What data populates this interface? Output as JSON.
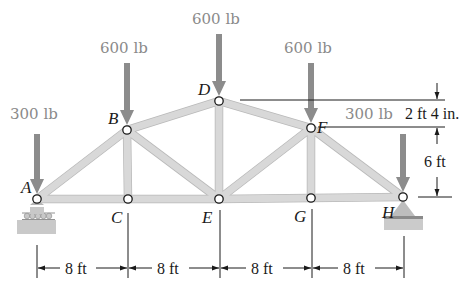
{
  "diagram": {
    "type": "truss",
    "nodes": [
      {
        "id": "A",
        "x": 37,
        "y": 199,
        "label_dx": -16,
        "label_dy": -6
      },
      {
        "id": "B",
        "x": 127,
        "y": 130,
        "label_dx": -19,
        "label_dy": -6
      },
      {
        "id": "C",
        "x": 128,
        "y": 199,
        "label_dx": -17,
        "label_dy": 24
      },
      {
        "id": "D",
        "x": 219,
        "y": 101,
        "label_dx": -21,
        "label_dy": -6
      },
      {
        "id": "E",
        "x": 219,
        "y": 199,
        "label_dx": -17,
        "label_dy": 24
      },
      {
        "id": "F",
        "x": 311,
        "y": 128,
        "label_dx": 6,
        "label_dy": 5
      },
      {
        "id": "G",
        "x": 311,
        "y": 198,
        "label_dx": -17,
        "label_dy": 24
      },
      {
        "id": "H",
        "x": 403,
        "y": 197,
        "label_dx": -21,
        "label_dy": 21
      }
    ],
    "members": [
      [
        "A",
        "B"
      ],
      [
        "B",
        "D"
      ],
      [
        "D",
        "F"
      ],
      [
        "F",
        "H"
      ],
      [
        "A",
        "C"
      ],
      [
        "C",
        "E"
      ],
      [
        "E",
        "G"
      ],
      [
        "G",
        "H"
      ],
      [
        "B",
        "C"
      ],
      [
        "B",
        "E"
      ],
      [
        "D",
        "E"
      ],
      [
        "E",
        "F"
      ],
      [
        "F",
        "G"
      ]
    ],
    "loads": [
      {
        "node": "A",
        "label": "300 lb",
        "label_x": 10,
        "label_y": 119,
        "arrow_top": 134
      },
      {
        "node": "B",
        "label": "600 lb",
        "label_x": 100,
        "label_y": 53,
        "arrow_top": 63
      },
      {
        "node": "D",
        "label": "600 lb",
        "label_x": 192,
        "label_y": 24,
        "arrow_top": 34
      },
      {
        "node": "F",
        "label": "600 lb",
        "label_x": 284,
        "label_y": 53,
        "arrow_top": 63
      },
      {
        "node": "H",
        "label": "300 lb",
        "label_x": 345,
        "label_y": 119,
        "arrow_top": 134
      }
    ],
    "supports": [
      {
        "node": "A",
        "type": "roller"
      },
      {
        "node": "H",
        "type": "pin"
      }
    ],
    "dimensions": {
      "horizontal": [
        "8 ft",
        "8 ft",
        "8 ft",
        "8 ft"
      ],
      "vertical": [
        {
          "label": "2 ft 4 in.",
          "from": "D",
          "to": "F"
        },
        {
          "label": "6 ft",
          "from": "F",
          "to": "H"
        }
      ]
    },
    "colors": {
      "member_fill": "#d8d8d8",
      "member_edge": "#b9b9b9",
      "load_arrow": "#8c8c8c",
      "text_load": "#8a8a8a",
      "ink": "#1a1a1a"
    }
  }
}
